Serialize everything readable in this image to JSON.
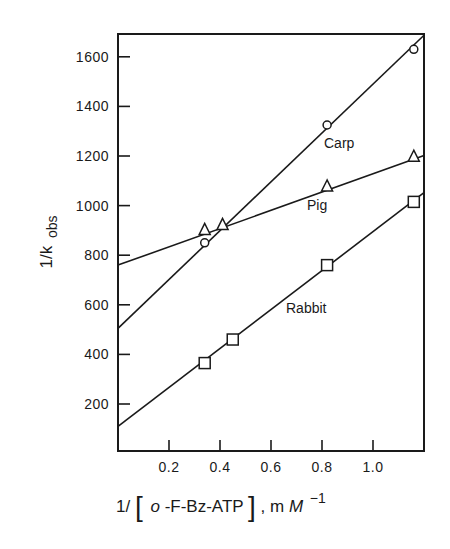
{
  "chart_data": {
    "type": "line",
    "title": "",
    "xlabel": "1/[o-F-Bz-ATP], mM^-1",
    "ylabel": "1/k obs",
    "xlim": [
      0,
      1.2
    ],
    "ylim": [
      0,
      1700
    ],
    "x_ticks": [
      0.2,
      0.4,
      0.6,
      0.8,
      1.0
    ],
    "x_tick_labels": [
      "0.2",
      "0.4",
      "0.6",
      "0.8",
      "1.0"
    ],
    "y_ticks": [
      200,
      400,
      600,
      800,
      1000,
      1200,
      1400,
      1600
    ],
    "y_tick_labels": [
      "200",
      "400",
      "600",
      "800",
      "1000",
      "1200",
      "1400",
      "1600"
    ],
    "grid": false,
    "legend": "inline labels",
    "series": [
      {
        "name": "Carp",
        "marker": "circle",
        "points": [
          [
            0.34,
            850
          ],
          [
            0.82,
            1325
          ],
          [
            1.16,
            1630
          ]
        ],
        "fit_line": {
          "intercept": 505,
          "slope": 985
        }
      },
      {
        "name": "Pig",
        "marker": "triangle",
        "points": [
          [
            0.34,
            900
          ],
          [
            0.41,
            920
          ],
          [
            0.82,
            1075
          ],
          [
            1.16,
            1195
          ]
        ],
        "fit_line": {
          "intercept": 760,
          "slope": 368
        }
      },
      {
        "name": "Rabbit",
        "marker": "square",
        "points": [
          [
            0.34,
            365
          ],
          [
            0.45,
            460
          ],
          [
            0.82,
            760
          ],
          [
            1.16,
            1015
          ]
        ],
        "fit_line": {
          "intercept": 110,
          "slope": 785
        }
      }
    ]
  },
  "labels": {
    "ylabel_main": "1/k",
    "ylabel_sub": "obs",
    "xlabel_prefix": "1/",
    "xlabel_bracket_open": "[",
    "xlabel_o": "o",
    "xlabel_compound": " -F-Bz-ATP",
    "xlabel_bracket_close": "]",
    "xlabel_units": ", m",
    "xlabel_M": "M",
    "xlabel_exp": "−1"
  }
}
